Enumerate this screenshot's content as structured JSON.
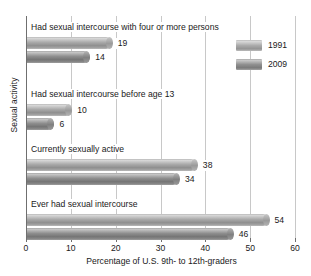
{
  "chart_data": {
    "type": "bar",
    "orientation": "horizontal",
    "title": "",
    "xlabel": "Percentage of U.S. 9th- to 12th-graders",
    "ylabel": "Sexual activity",
    "xlim": [
      0,
      60
    ],
    "xticks": [
      0,
      10,
      20,
      30,
      40,
      50,
      60
    ],
    "grid": true,
    "legend_position": "top-right",
    "categories": [
      "Had sexual intercourse with four or more persons",
      "Had sexual intercourse before age 13",
      "Currently sexually active",
      "Ever had sexual intercourse"
    ],
    "series": [
      {
        "name": "1991",
        "color": "#a9a9a9",
        "values": [
          19,
          10,
          38,
          54
        ]
      },
      {
        "name": "2009",
        "color": "#8e8e8e",
        "values": [
          14,
          6,
          34,
          46
        ]
      }
    ]
  },
  "axis": {
    "ylabel": "Sexual activity",
    "xlabel": "Percentage of U.S. 9th- to 12th-graders",
    "ticks": [
      "0",
      "10",
      "20",
      "30",
      "40",
      "50",
      "60"
    ]
  },
  "legend": {
    "items": [
      {
        "label": "1991"
      },
      {
        "label": "2009"
      }
    ]
  },
  "groups": [
    {
      "label": "Had sexual intercourse with four or more persons",
      "bars": [
        {
          "series": "1991",
          "value": 19,
          "value_text": "19"
        },
        {
          "series": "2009",
          "value": 14,
          "value_text": "14"
        }
      ]
    },
    {
      "label": "Had sexual intercourse before age 13",
      "bars": [
        {
          "series": "1991",
          "value": 10,
          "value_text": "10"
        },
        {
          "series": "2009",
          "value": 6,
          "value_text": "6"
        }
      ]
    },
    {
      "label": "Currently sexually active",
      "bars": [
        {
          "series": "1991",
          "value": 38,
          "value_text": "38"
        },
        {
          "series": "2009",
          "value": 34,
          "value_text": "34"
        }
      ]
    },
    {
      "label": "Ever had sexual intercourse",
      "bars": [
        {
          "series": "1991",
          "value": 54,
          "value_text": "54"
        },
        {
          "series": "2009",
          "value": 46,
          "value_text": "46"
        }
      ]
    }
  ]
}
